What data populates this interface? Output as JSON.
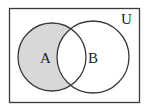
{
  "diagram": {
    "type": "venn",
    "universe_label": "U",
    "sets": [
      {
        "label": "A",
        "shaded": true
      },
      {
        "label": "B",
        "shaded": false
      }
    ],
    "shaded_region": "A minus B",
    "colors": {
      "shade": "#d8d8d8",
      "stroke": "#3a3a3a",
      "background": "#ffffff"
    }
  }
}
